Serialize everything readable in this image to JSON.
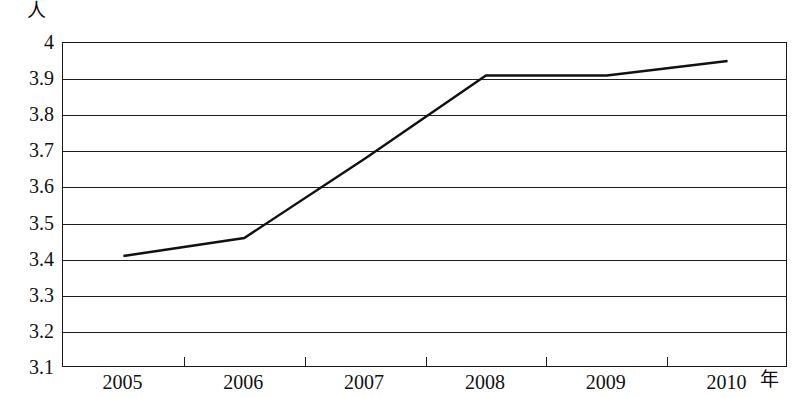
{
  "chart_data": {
    "type": "line",
    "title": "",
    "subtitle": "",
    "xlabel": "年",
    "ylabel": "人",
    "x": [
      2005,
      2006,
      2007,
      2008,
      2009,
      2010
    ],
    "categories": [
      "2005",
      "2006",
      "2007",
      "2008",
      "2009",
      "2010"
    ],
    "series": [
      {
        "name": "",
        "values": [
          3.41,
          3.46,
          3.68,
          3.91,
          3.91,
          3.95
        ]
      }
    ],
    "ylim": [
      3.1,
      4.0
    ],
    "y_ticks": [
      4,
      3.9,
      3.8,
      3.7,
      3.6,
      3.5,
      3.4,
      3.3,
      3.2,
      3.1
    ],
    "y_tick_labels": [
      "4",
      "3.9",
      "3.8",
      "3.7",
      "3.6",
      "3.5",
      "3.4",
      "3.3",
      "3.2",
      "3.1"
    ],
    "x_tick_labels": [
      "2005",
      "2006",
      "2007",
      "2008",
      "2009",
      "2010"
    ],
    "grid": true,
    "grid_axis": "y",
    "legend": false,
    "legend_position": "none",
    "line_color": "#111111",
    "line_width": 2.4,
    "markers": false,
    "annotations": []
  },
  "axes": {
    "y_unit_label": "人",
    "x_unit_label": "年"
  }
}
